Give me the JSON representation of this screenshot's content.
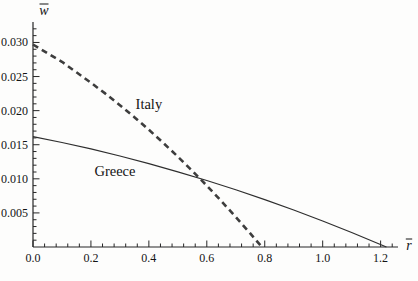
{
  "figure": {
    "background": "#fdfdfc",
    "axis_color": "#262626",
    "text_color": "#141414"
  },
  "chart_data": {
    "type": "line",
    "title": "",
    "xlabel": "r̄",
    "ylabel": "w̄",
    "xlim": [
      0,
      1.26
    ],
    "ylim": [
      0,
      0.033
    ],
    "grid": false,
    "legend_position": "inline-annotations",
    "x_ticks": {
      "values": [
        0,
        0.2,
        0.4,
        0.6,
        0.8,
        1.0,
        1.2
      ],
      "labels": [
        "0.0",
        "0.2",
        "0.4",
        "0.6",
        "0.8",
        "1.0",
        "1.2"
      ],
      "minor_step": 0.04
    },
    "y_ticks": {
      "values": [
        0.005,
        0.01,
        0.015,
        0.02,
        0.025,
        0.03
      ],
      "labels": [
        "0.005",
        "0.010",
        "0.015",
        "0.020",
        "0.025",
        "0.030"
      ],
      "minor_step": 0.001
    },
    "series": [
      {
        "name": "Italy",
        "line_style": "dashed",
        "color": "#3d3d3d",
        "stroke_width": 2.6,
        "x": [
          0,
          0.05,
          0.1,
          0.15,
          0.2,
          0.25,
          0.3,
          0.35,
          0.4,
          0.45,
          0.5,
          0.55,
          0.6,
          0.65,
          0.7,
          0.75,
          0.79
        ],
        "y": [
          0.0297,
          0.02842,
          0.02716,
          0.02562,
          0.02409,
          0.02249,
          0.0208,
          0.01904,
          0.01719,
          0.01526,
          0.01325,
          0.01116,
          0.00899,
          0.00674,
          0.0044,
          0.00199,
          0.0
        ],
        "annotation": {
          "text": "Italy",
          "x": 0.4,
          "y": 0.021
        }
      },
      {
        "name": "Greece",
        "line_style": "solid",
        "color": "#2e2e2e",
        "stroke_width": 1.2,
        "x": [
          0,
          0.1,
          0.2,
          0.3,
          0.4,
          0.5,
          0.6,
          0.7,
          0.8,
          0.9,
          1.0,
          1.1,
          1.22
        ],
        "y": [
          0.0162,
          0.01533,
          0.01438,
          0.01335,
          0.01223,
          0.01103,
          0.00976,
          0.0084,
          0.00695,
          0.00543,
          0.00382,
          0.00213,
          0.0
        ],
        "annotation": {
          "text": "Greece",
          "x": 0.283,
          "y": 0.0111
        }
      }
    ],
    "notes": {
      "intersection_approx": {
        "r": 0.57,
        "w": 0.0104
      }
    }
  }
}
